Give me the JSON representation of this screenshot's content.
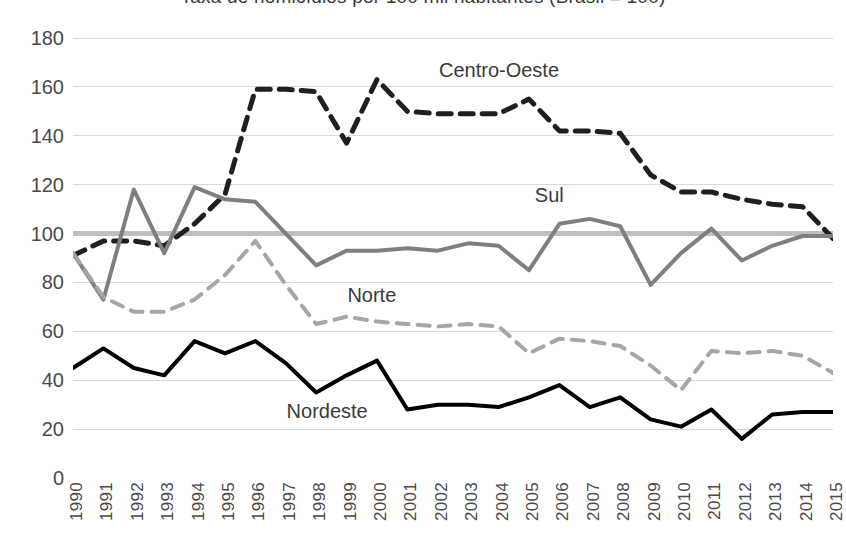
{
  "title": {
    "text": "Taxa de homicídios por 100 mil habitantes (Brasil = 100)"
  },
  "axes": {
    "y": {
      "ticks": [
        "0",
        "20",
        "40",
        "60",
        "80",
        "100",
        "120",
        "140",
        "160",
        "180"
      ],
      "min": 0,
      "max": 180,
      "step": 20,
      "label": ""
    },
    "x": {
      "ticks": [
        "1990",
        "1991",
        "1992",
        "1993",
        "1994",
        "1995",
        "1996",
        "1997",
        "1998",
        "1999",
        "2000",
        "2001",
        "2002",
        "2003",
        "2004",
        "2005",
        "2006",
        "2007",
        "2008",
        "2009",
        "2010",
        "2011",
        "2012",
        "2013",
        "2014",
        "2015"
      ],
      "label": ""
    }
  },
  "series_labels": {
    "centro_oeste": "Centro-Oeste",
    "sul": "Sul",
    "norte": "Norte",
    "nordeste": "Nordeste"
  },
  "colors": {
    "centro_oeste": "#1f1f1f",
    "sul": "#7f7f7f",
    "norte": "#a6a6a6",
    "nordeste": "#000000",
    "gridline": "#d9d9d9",
    "reference_line": "#bfbfbf",
    "tick_text": "#4a4a4a"
  },
  "reference_line": {
    "value": 100,
    "label": "Brasil = 100"
  },
  "chart_data": {
    "type": "line",
    "title": "Taxa de homicídios por 100 mil habitantes (Brasil = 100)",
    "xlabel": "",
    "ylabel": "",
    "ylim": [
      0,
      180
    ],
    "ytick_step": 20,
    "grid": true,
    "legend": "inline-annotations",
    "x": [
      "1990",
      "1991",
      "1992",
      "1993",
      "1994",
      "1995",
      "1996",
      "1997",
      "1998",
      "1999",
      "2000",
      "2001",
      "2002",
      "2003",
      "2004",
      "2005",
      "2006",
      "2007",
      "2008",
      "2009",
      "2010",
      "2011",
      "2012",
      "2013",
      "2014",
      "2015"
    ],
    "series": [
      {
        "name": "Centro-Oeste",
        "style": "dashed",
        "color": "#1f1f1f",
        "values": [
          91,
          97,
          97,
          95,
          104,
          116,
          159,
          159,
          158,
          137,
          163,
          150,
          149,
          149,
          149,
          155,
          142,
          142,
          141,
          124,
          117,
          117,
          114,
          112,
          111,
          98
        ]
      },
      {
        "name": "Sul",
        "style": "solid",
        "color": "#7f7f7f",
        "values": [
          92,
          73,
          118,
          92,
          119,
          114,
          113,
          100,
          87,
          93,
          93,
          94,
          93,
          96,
          95,
          85,
          104,
          106,
          103,
          79,
          92,
          102,
          89,
          95,
          99,
          99
        ]
      },
      {
        "name": "Norte",
        "style": "dashed",
        "color": "#a6a6a6",
        "values": [
          92,
          74,
          68,
          68,
          73,
          83,
          97,
          79,
          63,
          66,
          64,
          63,
          62,
          63,
          62,
          51,
          57,
          56,
          54,
          46,
          36,
          52,
          51,
          52,
          50,
          43
        ]
      },
      {
        "name": "Nordeste",
        "style": "solid",
        "color": "#000000",
        "values": [
          45,
          53,
          45,
          42,
          56,
          51,
          56,
          47,
          35,
          42,
          48,
          28,
          30,
          30,
          29,
          33,
          38,
          29,
          33,
          24,
          21,
          28,
          16,
          26,
          27,
          27
        ]
      }
    ]
  }
}
